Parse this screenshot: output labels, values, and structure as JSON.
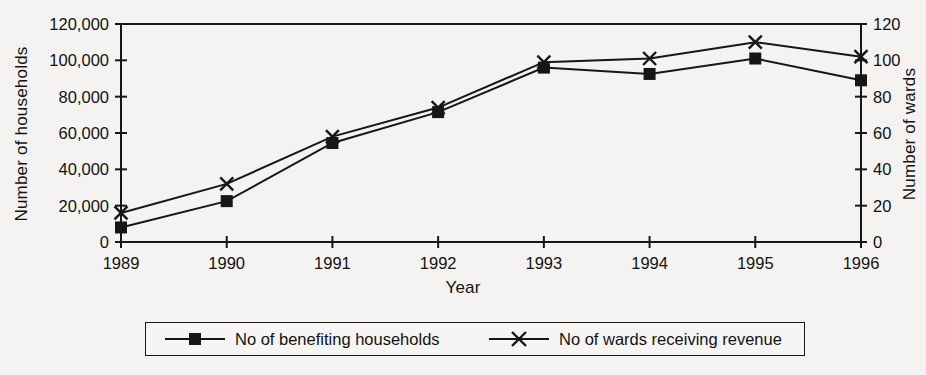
{
  "chart_data": {
    "type": "line",
    "title": "",
    "xlabel": "Year",
    "ylabel": "Number of households",
    "ylabel_secondary": "Number of wards",
    "categories": [
      "1989",
      "1990",
      "1991",
      "1992",
      "1993",
      "1994",
      "1995",
      "1996"
    ],
    "x": [
      1989,
      1990,
      1991,
      1992,
      1993,
      1994,
      1995,
      1996
    ],
    "xlim": [
      1989,
      1996
    ],
    "ylim": [
      0,
      120000
    ],
    "ylim_secondary": [
      0,
      120
    ],
    "yticks": [
      0,
      20000,
      40000,
      60000,
      80000,
      100000,
      120000
    ],
    "ytick_labels": [
      "0",
      "20,000",
      "40,000",
      "60,000",
      "80,000",
      "100,000",
      "120,000"
    ],
    "yticks_secondary": [
      0,
      20,
      40,
      60,
      80,
      100,
      120
    ],
    "ytick_labels_secondary": [
      "0",
      "20",
      "40",
      "60",
      "80",
      "100",
      "120"
    ],
    "grid": false,
    "legend_position": "bottom",
    "series": [
      {
        "name": "No of benefiting households",
        "axis": "left",
        "marker": "square",
        "color": "#161616",
        "values": [
          8000,
          22500,
          54500,
          71500,
          96000,
          92500,
          101000,
          89000
        ]
      },
      {
        "name": "No of wards receiving revenue",
        "axis": "right",
        "marker": "cross",
        "color": "#161616",
        "values": [
          16,
          32,
          58,
          74,
          99,
          101,
          110,
          102
        ]
      }
    ]
  },
  "legend": {
    "items": [
      {
        "label": "No of benefiting households",
        "marker": "square"
      },
      {
        "label": "No of wards receiving revenue",
        "marker": "cross"
      }
    ]
  }
}
